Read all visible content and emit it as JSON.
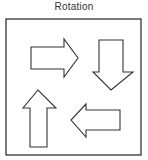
{
  "figure": {
    "title": "Rotation",
    "frame": {
      "x": 6,
      "y": 19,
      "width": 135,
      "height": 136,
      "stroke": "#333333"
    },
    "arrows": [
      {
        "direction": "right",
        "position": "top-left",
        "points": "31,47 64,47 64,39 78,58 64,77 64,69 31,69"
      },
      {
        "direction": "down",
        "position": "top-right",
        "points": "99,40 123,40 123,72 133,72 111,90 93,72 99,72"
      },
      {
        "direction": "left",
        "position": "bottom-right",
        "points": "120,110 86,110 86,104 71,120 86,137 86,130 120,130"
      },
      {
        "direction": "up",
        "position": "bottom-left",
        "points": "30,147 30,108 23,108 38,90 56,108 47,108 47,147"
      }
    ],
    "stroke_color": "#333333",
    "fill_color": "#ffffff"
  }
}
